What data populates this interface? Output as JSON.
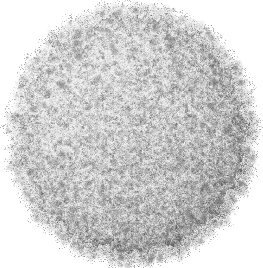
{
  "figure": {
    "kind": "molecular-surface-render",
    "subject_label": "Spherical virus capsid surface",
    "caption": "",
    "title": "",
    "background_color": "#ffffff",
    "canvas": {
      "width": 263,
      "height": 268
    },
    "sphere": {
      "center_x": 132,
      "center_y": 134,
      "radius_x": 120,
      "radius_y": 126,
      "shape": "sphere"
    },
    "palette": {
      "background": "#ffffff",
      "surface_lightest": "#f2f2f2",
      "surface_light": "#dcdcdc",
      "surface_mid": "#b4b4b4",
      "surface_dark": "#8a8a8a",
      "surface_darkest": "#606060",
      "knob_dark": "#6e6e6e",
      "rim_speckle": "#7a7a7a"
    },
    "lighting": {
      "highlight_direction": "upper-left",
      "shadow_direction": "lower-right",
      "highlight_strength": 0.22,
      "shadow_strength": 0.18
    },
    "texture": {
      "grain_size_px": 1.6,
      "grain_contrast": 0.58,
      "filament_density": 0.55,
      "noise_octaves": 4
    },
    "protrusions": {
      "count": 210,
      "rim_count": 120,
      "min_radius_px": 2,
      "max_radius_px": 6,
      "color": "#6e6e6e"
    },
    "rim": {
      "roughness_px": 9,
      "lobes": 46
    },
    "seed": 20240517
  }
}
